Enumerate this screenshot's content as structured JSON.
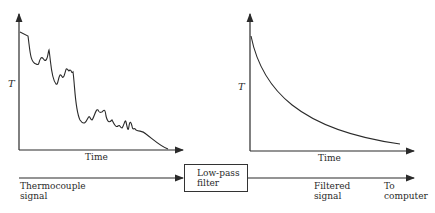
{
  "left_plot": {
    "y_label": "T",
    "x_label": "Time",
    "description": "Noisy thermocouple signal decaying stepwise with spikes"
  },
  "right_plot": {
    "y_label": "T",
    "x_label": "Time",
    "description": "Smooth exponential decay after filtering"
  },
  "flow": {
    "input_label": "Thermocouple signal",
    "input_line1": "Thermocouple",
    "input_line2": "signal",
    "block_line1": "Low-pass",
    "block_line2": "filter",
    "output_line1": "Filtered",
    "output_line2": "signal",
    "dest_line1": "To",
    "dest_line2": "computer"
  },
  "colors": {
    "ink": "#2a2a2a",
    "background": "#ffffff"
  }
}
